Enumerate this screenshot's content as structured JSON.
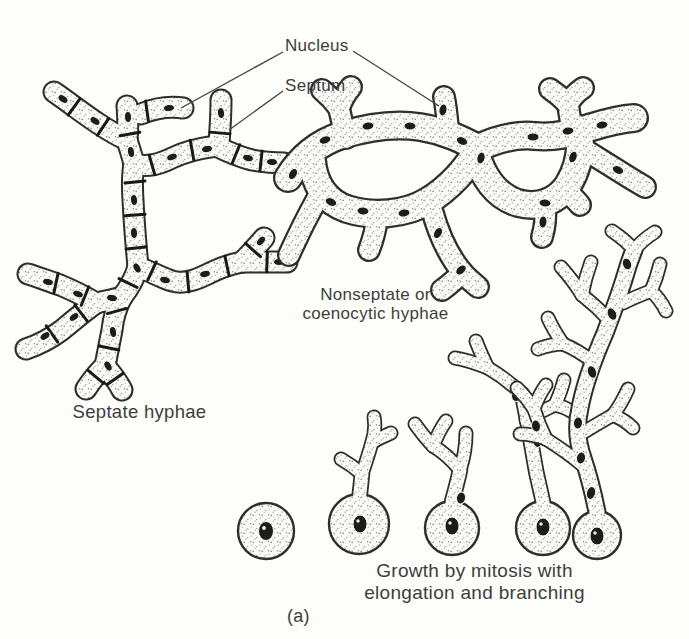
{
  "figure": {
    "callouts": {
      "nucleus": "Nucleus",
      "septum": "Septum"
    },
    "captions": {
      "septate": "Septate hyphae",
      "nonseptate_line1": "Nonseptate or",
      "nonseptate_line2": "coenocytic hyphae",
      "growth_line1": "Growth by mitosis with",
      "growth_line2": "elongation and branching",
      "subfigure": "(a)"
    },
    "colors": {
      "ink": "#2e2e2e",
      "paper": "#fdfdfa",
      "nucleus_fill": "#1c1c1c",
      "stipple_dot": "#8f8d88",
      "text": "#3d3d3d"
    }
  }
}
